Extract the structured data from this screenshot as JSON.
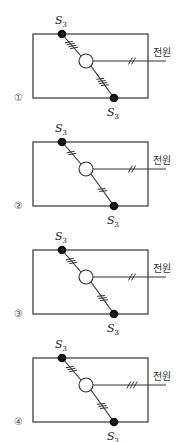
{
  "diagrams": [
    {
      "option": "①",
      "top_switch": {
        "label": "S",
        "subscript": "3"
      },
      "bottom_switch": {
        "label": "S",
        "subscript": "3"
      },
      "power_label": "전원",
      "ticks_top": 4,
      "ticks_bottom": 4,
      "ticks_power": 2
    },
    {
      "option": "②",
      "top_switch": {
        "label": "S",
        "subscript": "3"
      },
      "bottom_switch": {
        "label": "S",
        "subscript": "3"
      },
      "power_label": "전원",
      "ticks_top": 2,
      "ticks_bottom": 2,
      "ticks_power": 2
    },
    {
      "option": "③",
      "top_switch": {
        "label": "S",
        "subscript": "3"
      },
      "bottom_switch": {
        "label": "S",
        "subscript": "3"
      },
      "power_label": "전원",
      "ticks_top": 3,
      "ticks_bottom": 3,
      "ticks_power": 2
    },
    {
      "option": "④",
      "top_switch": {
        "label": "S",
        "subscript": "3"
      },
      "bottom_switch": {
        "label": "S",
        "subscript": "3"
      },
      "power_label": "전원",
      "ticks_top": 3,
      "ticks_bottom": 3,
      "ticks_power": 3
    }
  ],
  "colors": {
    "line": "#333333",
    "dot": "#111111",
    "lamp_fill": "#ffffff"
  }
}
